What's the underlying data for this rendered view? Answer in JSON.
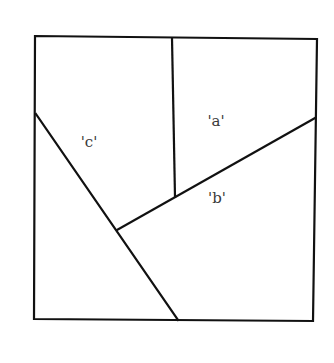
{
  "diagram": {
    "type": "partitioned-square",
    "outer_square": {
      "points": [
        [
          35,
          36
        ],
        [
          317,
          39
        ],
        [
          313,
          321
        ],
        [
          34,
          319
        ]
      ]
    },
    "lines": [
      {
        "name": "vertical-divider",
        "from": [
          172,
          38
        ],
        "to": [
          175,
          197
        ]
      },
      {
        "name": "diagonal-b",
        "from": [
          117,
          230
        ],
        "to": [
          315,
          118
        ]
      },
      {
        "name": "diagonal-c",
        "from": [
          36,
          114
        ],
        "to": [
          178,
          320
        ]
      }
    ],
    "labels": [
      {
        "id": "a",
        "text": "'a'",
        "x": 216,
        "y": 126
      },
      {
        "id": "b",
        "text": "'b'",
        "x": 217,
        "y": 203
      },
      {
        "id": "c",
        "text": "'c'",
        "x": 89,
        "y": 147
      }
    ],
    "colors": {
      "line": "#111111",
      "label": "#3a3a3a",
      "background": "#ffffff"
    }
  }
}
